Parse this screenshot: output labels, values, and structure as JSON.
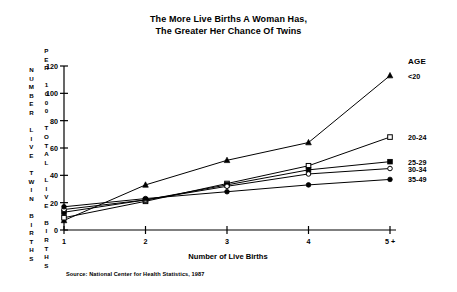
{
  "title": {
    "line1": "The More Live Births A Woman Has,",
    "line2": "The Greater Her Chance Of Twins"
  },
  "axis_labels": {
    "y_outer_words": [
      "NUMBER",
      "LIVE",
      "TWIN",
      "BIRTHS"
    ],
    "y_inner_words": [
      "PER",
      "1000",
      "TOTAL",
      "LIVE",
      "BIRTHS"
    ],
    "y_outer_text": "NUMBER LIVE TWIN BIRTHS",
    "y_inner_text": "PER 1000 TOTAL LIVE BIRTHS",
    "x_title": "Number of Live Births"
  },
  "legend": {
    "title": "AGE",
    "items": [
      {
        "label": "<20",
        "marker": "filled-triangle"
      },
      {
        "label": "20-24",
        "marker": "open-square"
      },
      {
        "label": "25-29",
        "marker": "filled-square"
      },
      {
        "label": "30-34",
        "marker": "open-circle"
      },
      {
        "label": "35-49",
        "marker": "filled-circle"
      }
    ]
  },
  "source": "Source:  National Center for Health Statistics, 1987",
  "colors": {
    "ink": "#000000",
    "background": "#ffffff"
  },
  "chart_data": {
    "type": "line",
    "title": "The More Live Births A Woman Has, The Greater Her Chance Of Twins",
    "xlabel": "Number of Live Births",
    "ylabel": "NUMBER LIVE TWIN BIRTHS PER 1000 TOTAL LIVE BIRTHS",
    "categories": [
      "1",
      "2",
      "3",
      "4",
      "5 +"
    ],
    "x_tick_labels": [
      "1",
      "2",
      "3",
      "4",
      "5 +"
    ],
    "y_tick_labels": [
      "0",
      "20",
      "40",
      "60",
      "80",
      "100",
      "120"
    ],
    "ylim": [
      0,
      120
    ],
    "ytick_step": 20,
    "grid": false,
    "legend_position": "right",
    "legend_title": "AGE",
    "series": [
      {
        "name": "<20",
        "marker": "filled-triangle",
        "values": [
          7,
          33,
          51,
          64,
          113
        ]
      },
      {
        "name": "20-24",
        "marker": "open-square",
        "values": [
          9,
          21,
          34,
          47,
          68
        ]
      },
      {
        "name": "25-29",
        "marker": "filled-square",
        "values": [
          13,
          22,
          33,
          44,
          50
        ]
      },
      {
        "name": "30-34",
        "marker": "open-circle",
        "values": [
          15,
          22,
          32,
          41,
          45
        ]
      },
      {
        "name": "35-49",
        "marker": "filled-circle",
        "values": [
          17,
          23,
          28,
          33,
          37
        ]
      }
    ],
    "source": "Source:  National Center for Health Statistics, 1987"
  }
}
